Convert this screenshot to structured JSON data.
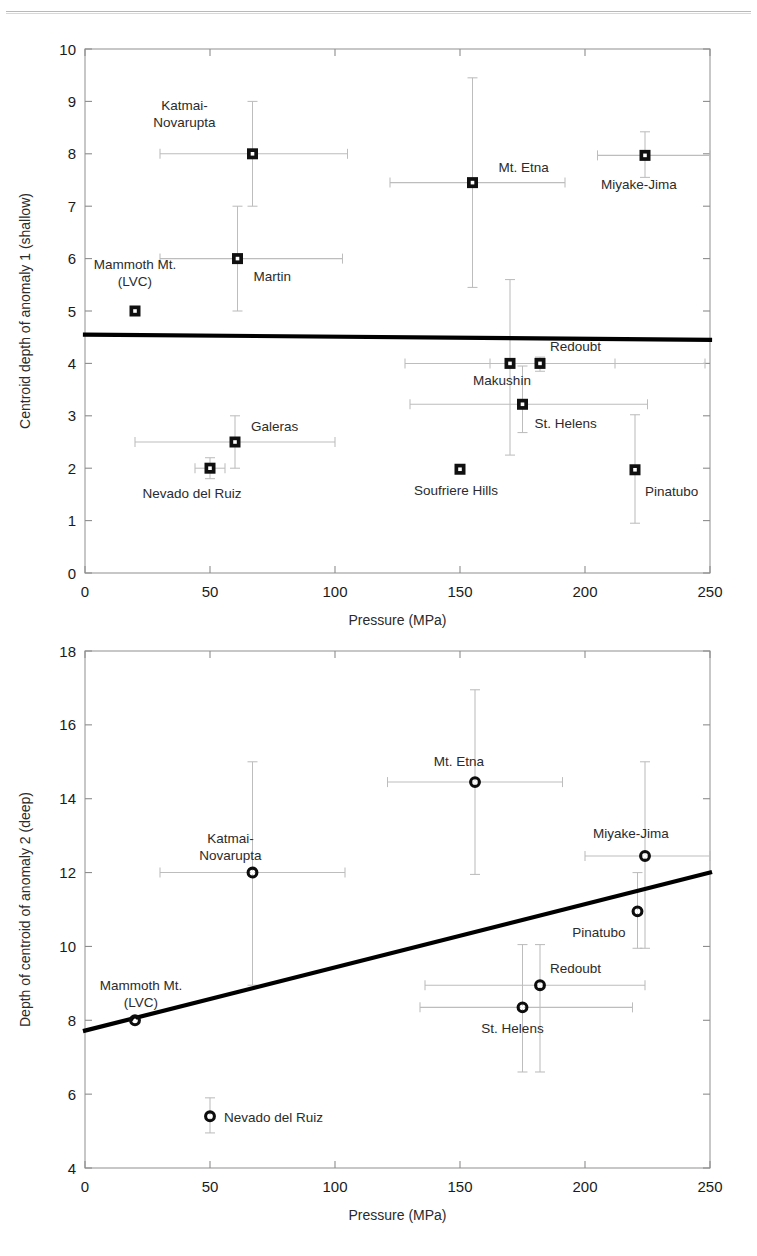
{
  "page": {
    "header_rule": true,
    "background": "#ffffff",
    "marker_color": "#101010",
    "errorbar_color": "#bdbdbd",
    "fitline_color": "#000000"
  },
  "figures": [
    {
      "id": "fig-top",
      "xlabel": "Pressure (MPa)",
      "ylabel": "Centroid depth of anomaly 1 (shallow)",
      "xticks": [
        "0",
        "50",
        "100",
        "150",
        "200",
        "250"
      ],
      "yticks": [
        "0",
        "1",
        "2",
        "3",
        "4",
        "5",
        "6",
        "7",
        "8",
        "9",
        "10"
      ]
    },
    {
      "id": "fig-bottom",
      "xlabel": "Pressure (MPa)",
      "ylabel": "Depth of centroid of anomaly 2 (deep)",
      "xticks": [
        "0",
        "50",
        "100",
        "150",
        "200",
        "250"
      ],
      "yticks": [
        "4",
        "6",
        "8",
        "10",
        "12",
        "14",
        "16",
        "18"
      ]
    }
  ],
  "chart_data": [
    {
      "type": "scatter",
      "id": "anomaly-1-shallow",
      "title": "",
      "xlabel": "Pressure (MPa)",
      "ylabel": "Centroid depth of anomaly 1 (shallow)",
      "xlim": [
        0,
        250
      ],
      "ylim": [
        0,
        10
      ],
      "xticks": [
        0,
        50,
        100,
        150,
        200,
        250
      ],
      "yticks": [
        0,
        1,
        2,
        3,
        4,
        5,
        6,
        7,
        8,
        9,
        10
      ],
      "grid": false,
      "legend": "none",
      "marker": "filled-square",
      "fit_line": {
        "x": [
          0,
          250
        ],
        "y": [
          4.55,
          4.45
        ],
        "style": "solid-thick"
      },
      "points": [
        {
          "label": "Katmai-Novarupta",
          "x": 67,
          "y": 8.0,
          "xerr_low": 30,
          "xerr_high": 105,
          "yerr_low": 7.0,
          "yerr_high": 9.0,
          "label_dx": -68,
          "label_dy": -44,
          "label_anchor": "middle",
          "label_lines": [
            "Katmai-",
            "Novarupta"
          ]
        },
        {
          "label": "Mt. Etna",
          "x": 155,
          "y": 7.45,
          "xerr_low": 122,
          "xerr_high": 192,
          "yerr_low": 5.45,
          "yerr_high": 9.45,
          "label_dx": 26,
          "label_dy": -11,
          "label_anchor": "start",
          "label_lines": [
            "Mt. Etna"
          ]
        },
        {
          "label": "Miyake-Jima",
          "x": 224,
          "y": 7.97,
          "xerr_low": 205,
          "xerr_high": 250,
          "yerr_low": 7.55,
          "yerr_high": 8.42,
          "label_dx": -6,
          "label_dy": 34,
          "label_anchor": "middle",
          "label_lines": [
            "Miyake-Jima"
          ]
        },
        {
          "label": "Martin",
          "x": 61,
          "y": 6.0,
          "xerr_low": 30,
          "xerr_high": 103,
          "yerr_low": 5.0,
          "yerr_high": 7.0,
          "label_dx": 16,
          "label_dy": 22,
          "label_anchor": "start",
          "label_lines": [
            "Martin"
          ]
        },
        {
          "label": "Mammoth Mt. (LVC)",
          "x": 20,
          "y": 5.0,
          "xerr_low": null,
          "xerr_high": null,
          "yerr_low": null,
          "yerr_high": null,
          "label_dx": 0,
          "label_dy": -42,
          "label_anchor": "middle",
          "label_lines": [
            "Mammoth Mt.",
            "(LVC)"
          ]
        },
        {
          "label": "Makushin",
          "x": 170,
          "y": 4.0,
          "xerr_low": 128,
          "xerr_high": 212,
          "yerr_low": 2.25,
          "yerr_high": 5.6,
          "label_dx": -8,
          "label_dy": 22,
          "label_anchor": "middle",
          "label_lines": [
            "Makushin"
          ]
        },
        {
          "label": "Redoubt",
          "x": 182,
          "y": 4.0,
          "xerr_low": 162,
          "xerr_high": 248,
          "yerr_low": 3.85,
          "yerr_high": 4.12,
          "label_dx": 10,
          "label_dy": -12,
          "label_anchor": "start",
          "label_lines": [
            "Redoubt"
          ]
        },
        {
          "label": "St. Helens",
          "x": 175,
          "y": 3.22,
          "xerr_low": 130,
          "xerr_high": 225,
          "yerr_low": 2.68,
          "yerr_high": 3.95,
          "label_dx": 12,
          "label_dy": 24,
          "label_anchor": "start",
          "label_lines": [
            "St. Helens"
          ]
        },
        {
          "label": "Galeras",
          "x": 60,
          "y": 2.5,
          "xerr_low": 20,
          "xerr_high": 100,
          "yerr_low": 2.0,
          "yerr_high": 3.0,
          "label_dx": 16,
          "label_dy": -11,
          "label_anchor": "start",
          "label_lines": [
            "Galeras"
          ]
        },
        {
          "label": "Nevado del Ruiz",
          "x": 50,
          "y": 2.0,
          "xerr_low": 44,
          "xerr_high": 56,
          "yerr_low": 1.8,
          "yerr_high": 2.2,
          "label_dx": -18,
          "label_dy": 30,
          "label_anchor": "middle",
          "label_lines": [
            "Nevado del Ruiz"
          ]
        },
        {
          "label": "Soufriere Hills",
          "x": 150,
          "y": 1.98,
          "xerr_low": null,
          "xerr_high": null,
          "yerr_low": null,
          "yerr_high": null,
          "label_dx": -4,
          "label_dy": 26,
          "label_anchor": "middle",
          "label_lines": [
            "Soufriere Hills"
          ]
        },
        {
          "label": "Pinatubo",
          "x": 220,
          "y": 1.97,
          "xerr_low": null,
          "xerr_high": null,
          "yerr_low": 0.95,
          "yerr_high": 3.02,
          "label_dx": 10,
          "label_dy": 26,
          "label_anchor": "start",
          "label_lines": [
            "Pinatubo"
          ]
        }
      ]
    },
    {
      "type": "scatter",
      "id": "anomaly-2-deep",
      "title": "",
      "xlabel": "Pressure (MPa)",
      "ylabel": "Depth of centroid of anomaly 2 (deep)",
      "xlim": [
        0,
        250
      ],
      "ylim": [
        4,
        18
      ],
      "xticks": [
        0,
        50,
        100,
        150,
        200,
        250
      ],
      "yticks": [
        4,
        6,
        8,
        10,
        12,
        14,
        16,
        18
      ],
      "grid": false,
      "legend": "none",
      "marker": "open-circle",
      "fit_line": {
        "x": [
          0,
          250
        ],
        "y": [
          7.72,
          12.0
        ],
        "style": "solid-thick"
      },
      "points": [
        {
          "label": "Mt. Etna",
          "x": 156,
          "y": 14.45,
          "xerr_low": 121,
          "xerr_high": 191,
          "yerr_low": 11.95,
          "yerr_high": 16.95,
          "label_dx": -16,
          "label_dy": -16,
          "label_anchor": "middle",
          "label_lines": [
            "Mt. Etna"
          ]
        },
        {
          "label": "Miyake-Jima",
          "x": 224,
          "y": 12.45,
          "xerr_low": 200,
          "xerr_high": 250,
          "yerr_low": 9.95,
          "yerr_high": 15.0,
          "label_dx": -14,
          "label_dy": -18,
          "label_anchor": "middle",
          "label_lines": [
            "Miyake-Jima"
          ]
        },
        {
          "label": "Katmai-Novarupta",
          "x": 67,
          "y": 12.0,
          "xerr_low": 30,
          "xerr_high": 104,
          "yerr_low": 8.95,
          "yerr_high": 15.0,
          "label_dx": -22,
          "label_dy": -30,
          "label_anchor": "middle",
          "label_lines": [
            "Katmai-",
            "Novarupta"
          ]
        },
        {
          "label": "Pinatubo",
          "x": 221,
          "y": 10.95,
          "xerr_low": null,
          "xerr_high": null,
          "yerr_low": 9.95,
          "yerr_high": 12.0,
          "label_dx": -12,
          "label_dy": 26,
          "label_anchor": "end",
          "label_lines": [
            "Pinatubo"
          ]
        },
        {
          "label": "Redoubt",
          "x": 182,
          "y": 8.95,
          "xerr_low": 136,
          "xerr_high": 224,
          "yerr_low": 6.6,
          "yerr_high": 10.05,
          "label_dx": 10,
          "label_dy": -12,
          "label_anchor": "start",
          "label_lines": [
            "Redoubt"
          ]
        },
        {
          "label": "St. Helens",
          "x": 175,
          "y": 8.35,
          "xerr_low": 134,
          "xerr_high": 219,
          "yerr_low": 6.6,
          "yerr_high": 10.05,
          "label_dx": -10,
          "label_dy": 26,
          "label_anchor": "middle",
          "label_lines": [
            "St. Helens"
          ]
        },
        {
          "label": "Mammoth Mt. (LVC)",
          "x": 20,
          "y": 8.0,
          "xerr_low": null,
          "xerr_high": null,
          "yerr_low": null,
          "yerr_high": null,
          "label_dx": 6,
          "label_dy": -30,
          "label_anchor": "middle",
          "label_lines": [
            "Mammoth Mt.",
            "(LVC)"
          ]
        },
        {
          "label": "Nevado del Ruiz",
          "x": 50,
          "y": 5.4,
          "xerr_low": null,
          "xerr_high": null,
          "yerr_low": 4.95,
          "yerr_high": 5.9,
          "label_dx": 14,
          "label_dy": 6,
          "label_anchor": "start",
          "label_lines": [
            "Nevado del Ruiz"
          ]
        }
      ]
    }
  ]
}
